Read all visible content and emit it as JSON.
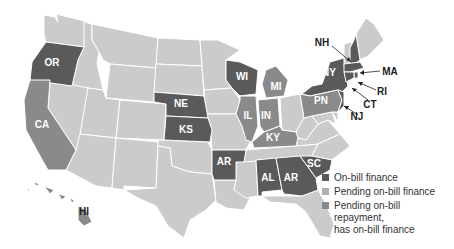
{
  "colors": {
    "on_bill_finance": "#5a5a5a",
    "pending_on_bill_finance": "#b0b0b0",
    "pending_repayment_has_finance": "#8a8a8a",
    "no_program": "#cbcbcb",
    "border": "#ffffff"
  },
  "legend": [
    {
      "key": "on_bill_finance",
      "label_lines": [
        "On-bill finance"
      ]
    },
    {
      "key": "pending_on_bill_finance",
      "label_lines": [
        "Pending on-bill finance"
      ]
    },
    {
      "key": "pending_repayment_has_finance",
      "label_lines": [
        "Pending on-bill",
        "repayment,",
        "has on-bill finance"
      ]
    }
  ],
  "states": {
    "OR": {
      "label": "OR",
      "status": "on_bill_finance"
    },
    "CA": {
      "label": "CA",
      "status": "pending_repayment_has_finance"
    },
    "HI": {
      "label": "HI",
      "status": "pending_repayment_has_finance"
    },
    "NE": {
      "label": "NE",
      "status": "on_bill_finance"
    },
    "KS": {
      "label": "KS",
      "status": "on_bill_finance"
    },
    "WI": {
      "label": "WI",
      "status": "on_bill_finance"
    },
    "MI": {
      "label": "MI",
      "status": "pending_repayment_has_finance"
    },
    "IL": {
      "label": "IL",
      "status": "pending_repayment_has_finance"
    },
    "IN": {
      "label": "IN",
      "status": "pending_repayment_has_finance"
    },
    "KY": {
      "label": "KY",
      "status": "pending_repayment_has_finance"
    },
    "AR": {
      "label": "AR",
      "status": "on_bill_finance"
    },
    "AL": {
      "label": "AL",
      "status": "on_bill_finance"
    },
    "GA": {
      "label": "AR",
      "status": "on_bill_finance"
    },
    "SC": {
      "label": "SC",
      "status": "on_bill_finance"
    },
    "NY": {
      "label": "NY",
      "status": "on_bill_finance"
    },
    "PA": {
      "label": "PN",
      "status": "pending_repayment_has_finance"
    },
    "NH": {
      "label": "NH",
      "status": "on_bill_finance"
    },
    "MA": {
      "label": "MA",
      "status": "on_bill_finance"
    },
    "RI": {
      "label": "RI",
      "status": "on_bill_finance"
    },
    "CT": {
      "label": "CT",
      "status": "on_bill_finance"
    },
    "NJ": {
      "label": "NJ",
      "status": "on_bill_finance"
    }
  }
}
